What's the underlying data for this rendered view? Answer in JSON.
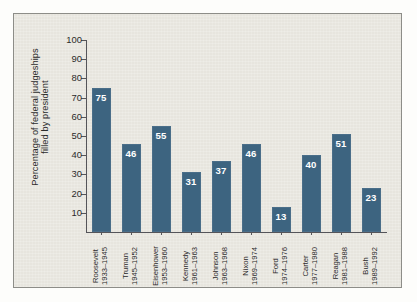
{
  "chart_data": {
    "type": "bar",
    "title": "",
    "xlabel": "",
    "ylabel_line1": "Percentage of federal judgeships",
    "ylabel_line2": "filled by president",
    "ylabel": "Percentage of federal judgeships filled by president",
    "ylim": [
      0,
      100
    ],
    "ytick_labels": [
      "100",
      "90",
      "80",
      "70",
      "60",
      "50",
      "40",
      "30",
      "20",
      "10"
    ],
    "ytick_values": [
      100,
      90,
      80,
      70,
      60,
      50,
      40,
      30,
      20,
      10
    ],
    "grid": false,
    "legend": false,
    "bar_color": "#3d6480",
    "value_label_color": "#ffffff",
    "categories": [
      "Roosevelt 1933-1945",
      "Truman 1945-1952",
      "Eisenhower 1953-1960",
      "Kennedy 1961-1963",
      "Johnson 1963-1968",
      "Nixon 1969-1974",
      "Ford 1974-1976",
      "Carter 1977-1980",
      "Reagan 1981-1988",
      "Bush 1989-1992"
    ],
    "values": [
      75,
      46,
      55,
      31,
      37,
      46,
      13,
      40,
      51,
      23
    ],
    "bars": [
      {
        "name": "Roosevelt",
        "term": "1933–1945",
        "value": 75,
        "value_label": "75"
      },
      {
        "name": "Truman",
        "term": "1945–1952",
        "value": 46,
        "value_label": "46"
      },
      {
        "name": "Eisenhower",
        "term": "1953–1960",
        "value": 55,
        "value_label": "55"
      },
      {
        "name": "Kennedy",
        "term": "1961–1963",
        "value": 31,
        "value_label": "31"
      },
      {
        "name": "Johnson",
        "term": "1963–1968",
        "value": 37,
        "value_label": "37"
      },
      {
        "name": "Nixon",
        "term": "1969–1974",
        "value": 46,
        "value_label": "46"
      },
      {
        "name": "Ford",
        "term": "1974–1976",
        "value": 13,
        "value_label": "13"
      },
      {
        "name": "Carter",
        "term": "1977–1980",
        "value": 40,
        "value_label": "40"
      },
      {
        "name": "Reagan",
        "term": "1981–1988",
        "value": 51,
        "value_label": "51"
      },
      {
        "name": "Bush",
        "term": "1989–1992",
        "value": 23,
        "value_label": "23"
      }
    ]
  }
}
